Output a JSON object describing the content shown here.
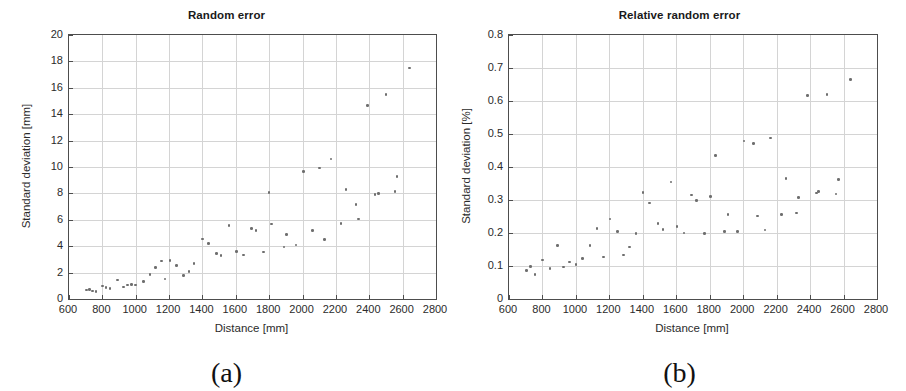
{
  "figure": {
    "panel_count": 2
  },
  "panels": [
    {
      "key": "a",
      "subfig_label": "(a)",
      "title": "Random error",
      "xlabel": "Distance [mm]",
      "ylabel": "Standard deviation [mm]",
      "xticks": [
        "600",
        "800",
        "1000",
        "1200",
        "1400",
        "1600",
        "1800",
        "2000",
        "2200",
        "2400",
        "2600",
        "2800"
      ],
      "yticks": [
        "0",
        "2",
        "4",
        "6",
        "8",
        "10",
        "12",
        "14",
        "16",
        "18",
        "20"
      ]
    },
    {
      "key": "b",
      "subfig_label": "(b)",
      "title": "Relative random error",
      "xlabel": "Distance [mm]",
      "ylabel": "Standard deviation [%]",
      "xticks": [
        "600",
        "800",
        "1000",
        "1200",
        "1400",
        "1600",
        "1800",
        "2000",
        "2200",
        "2400",
        "2600",
        "2800"
      ],
      "yticks": [
        "0",
        "0.1",
        "0.2",
        "0.3",
        "0.4",
        "0.5",
        "0.6",
        "0.7",
        "0.8"
      ]
    }
  ],
  "chart_data": [
    {
      "type": "scatter",
      "title": "Random error",
      "subfigure": "(a)",
      "xlabel": "Distance [mm]",
      "ylabel": "Standard deviation [mm]",
      "xlim": [
        600,
        2800
      ],
      "ylim": [
        0,
        20
      ],
      "xtick_values": [
        600,
        800,
        1000,
        1200,
        1400,
        1600,
        1800,
        2000,
        2200,
        2400,
        2600,
        2800
      ],
      "ytick_values": [
        0,
        2,
        4,
        6,
        8,
        10,
        12,
        14,
        16,
        18,
        20
      ],
      "grid": true,
      "legend": "none",
      "marker_color": "#6e6e6e",
      "points": [
        {
          "x": 705,
          "y": 0.68
        },
        {
          "x": 722,
          "y": 0.72
        },
        {
          "x": 740,
          "y": 0.62
        },
        {
          "x": 762,
          "y": 0.58
        },
        {
          "x": 800,
          "y": 0.98
        },
        {
          "x": 822,
          "y": 0.88
        },
        {
          "x": 845,
          "y": 0.8
        },
        {
          "x": 890,
          "y": 1.45
        },
        {
          "x": 925,
          "y": 0.9
        },
        {
          "x": 950,
          "y": 1.05
        },
        {
          "x": 975,
          "y": 1.08
        },
        {
          "x": 1000,
          "y": 1.06
        },
        {
          "x": 1048,
          "y": 1.32
        },
        {
          "x": 1085,
          "y": 1.85
        },
        {
          "x": 1120,
          "y": 2.4
        },
        {
          "x": 1155,
          "y": 2.88
        },
        {
          "x": 1175,
          "y": 1.5
        },
        {
          "x": 1205,
          "y": 2.92
        },
        {
          "x": 1245,
          "y": 2.55
        },
        {
          "x": 1285,
          "y": 1.78
        },
        {
          "x": 1320,
          "y": 2.08
        },
        {
          "x": 1350,
          "y": 2.68
        },
        {
          "x": 1400,
          "y": 4.55
        },
        {
          "x": 1435,
          "y": 4.2
        },
        {
          "x": 1485,
          "y": 3.45
        },
        {
          "x": 1510,
          "y": 3.3
        },
        {
          "x": 1560,
          "y": 5.58
        },
        {
          "x": 1605,
          "y": 3.58
        },
        {
          "x": 1645,
          "y": 3.32
        },
        {
          "x": 1695,
          "y": 5.32
        },
        {
          "x": 1720,
          "y": 5.18
        },
        {
          "x": 1765,
          "y": 3.55
        },
        {
          "x": 1800,
          "y": 8.05
        },
        {
          "x": 1815,
          "y": 5.68
        },
        {
          "x": 1890,
          "y": 3.95
        },
        {
          "x": 1905,
          "y": 4.9
        },
        {
          "x": 1960,
          "y": 4.08
        },
        {
          "x": 2005,
          "y": 9.68
        },
        {
          "x": 2060,
          "y": 5.2
        },
        {
          "x": 2100,
          "y": 9.92
        },
        {
          "x": 2130,
          "y": 4.5
        },
        {
          "x": 2170,
          "y": 10.62
        },
        {
          "x": 2230,
          "y": 5.72
        },
        {
          "x": 2260,
          "y": 8.28
        },
        {
          "x": 2320,
          "y": 7.15
        },
        {
          "x": 2335,
          "y": 6.05
        },
        {
          "x": 2390,
          "y": 14.65
        },
        {
          "x": 2435,
          "y": 7.92
        },
        {
          "x": 2455,
          "y": 8.0
        },
        {
          "x": 2500,
          "y": 15.5
        },
        {
          "x": 2555,
          "y": 8.15
        },
        {
          "x": 2565,
          "y": 9.3
        },
        {
          "x": 2640,
          "y": 17.5
        }
      ]
    },
    {
      "type": "scatter",
      "title": "Relative random error",
      "subfigure": "(b)",
      "xlabel": "Distance [mm]",
      "ylabel": "Standard deviation [%]",
      "xlim": [
        600,
        2800
      ],
      "ylim": [
        0,
        0.8
      ],
      "xtick_values": [
        600,
        800,
        1000,
        1200,
        1400,
        1600,
        1800,
        2000,
        2200,
        2400,
        2600,
        2800
      ],
      "ytick_values": [
        0,
        0.1,
        0.2,
        0.3,
        0.4,
        0.5,
        0.6,
        0.7,
        0.8
      ],
      "grid": true,
      "legend": "none",
      "marker_color": "#6e6e6e",
      "points": [
        {
          "x": 705,
          "y": 0.087
        },
        {
          "x": 728,
          "y": 0.098
        },
        {
          "x": 755,
          "y": 0.075
        },
        {
          "x": 800,
          "y": 0.118
        },
        {
          "x": 845,
          "y": 0.093
        },
        {
          "x": 890,
          "y": 0.163
        },
        {
          "x": 925,
          "y": 0.097
        },
        {
          "x": 960,
          "y": 0.112
        },
        {
          "x": 1000,
          "y": 0.105
        },
        {
          "x": 1040,
          "y": 0.123
        },
        {
          "x": 1085,
          "y": 0.163
        },
        {
          "x": 1125,
          "y": 0.213
        },
        {
          "x": 1165,
          "y": 0.127
        },
        {
          "x": 1205,
          "y": 0.242
        },
        {
          "x": 1248,
          "y": 0.205
        },
        {
          "x": 1285,
          "y": 0.133
        },
        {
          "x": 1320,
          "y": 0.157
        },
        {
          "x": 1360,
          "y": 0.198
        },
        {
          "x": 1400,
          "y": 0.323
        },
        {
          "x": 1440,
          "y": 0.291
        },
        {
          "x": 1490,
          "y": 0.228
        },
        {
          "x": 1520,
          "y": 0.21
        },
        {
          "x": 1568,
          "y": 0.355
        },
        {
          "x": 1605,
          "y": 0.22
        },
        {
          "x": 1645,
          "y": 0.2
        },
        {
          "x": 1690,
          "y": 0.315
        },
        {
          "x": 1720,
          "y": 0.298
        },
        {
          "x": 1770,
          "y": 0.199
        },
        {
          "x": 1805,
          "y": 0.311
        },
        {
          "x": 1835,
          "y": 0.435
        },
        {
          "x": 1890,
          "y": 0.205
        },
        {
          "x": 1910,
          "y": 0.256
        },
        {
          "x": 1965,
          "y": 0.205
        },
        {
          "x": 2005,
          "y": 0.479
        },
        {
          "x": 2060,
          "y": 0.471
        },
        {
          "x": 2085,
          "y": 0.251
        },
        {
          "x": 2130,
          "y": 0.209
        },
        {
          "x": 2165,
          "y": 0.488
        },
        {
          "x": 2230,
          "y": 0.256
        },
        {
          "x": 2255,
          "y": 0.366
        },
        {
          "x": 2320,
          "y": 0.261
        },
        {
          "x": 2330,
          "y": 0.307
        },
        {
          "x": 2385,
          "y": 0.616
        },
        {
          "x": 2440,
          "y": 0.321
        },
        {
          "x": 2450,
          "y": 0.325
        },
        {
          "x": 2500,
          "y": 0.62
        },
        {
          "x": 2555,
          "y": 0.318
        },
        {
          "x": 2570,
          "y": 0.362
        },
        {
          "x": 2640,
          "y": 0.665
        }
      ]
    }
  ]
}
